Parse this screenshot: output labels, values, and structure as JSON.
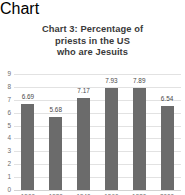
{
  "chart_data": {
    "type": "bar",
    "title": "Chart 3: Percentage of priests in the US who are Jesuits",
    "title_lines": [
      "Chart 3: Percentage of",
      "priests in the US",
      "who are Jesuits"
    ],
    "categories": [
      "1900",
      "1920",
      "1940",
      "1960",
      "1980",
      "2000"
    ],
    "values": [
      6.69,
      5.68,
      7.17,
      7.93,
      7.89,
      6.54
    ],
    "value_labels": [
      "6.69",
      "5.68",
      "7.17",
      "7.93",
      "7.89",
      "6.54"
    ],
    "xlabel": "",
    "ylabel": "",
    "ylim": [
      0,
      9
    ],
    "yticks": [
      "9",
      "8",
      "7",
      "6",
      "5",
      "4",
      "3",
      "2",
      "1",
      "0"
    ],
    "grid": true,
    "legend": false,
    "colors": {
      "bar": "#6b6b6b",
      "gridline": "#e2e2e2",
      "title_text": "#3a3a3a",
      "tick_text": "#6d6d6d",
      "value_text": "#4a4a4a",
      "background": "#ffffff"
    }
  }
}
